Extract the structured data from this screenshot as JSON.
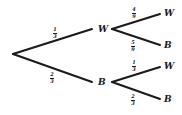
{
  "tree": {
    "stage1": [
      {
        "outcome": "W",
        "probability": "1/3",
        "num": "1",
        "den": "3"
      },
      {
        "outcome": "B",
        "probability": "2/3",
        "num": "2",
        "den": "3"
      }
    ],
    "stage2_after_W": [
      {
        "outcome": "W",
        "probability": "4/9",
        "num": "4",
        "den": "9"
      },
      {
        "outcome": "B",
        "probability": "5/9",
        "num": "5",
        "den": "9"
      }
    ],
    "stage2_after_B": [
      {
        "outcome": "W",
        "probability": "1/3",
        "num": "1",
        "den": "3"
      },
      {
        "outcome": "B",
        "probability": "2/3",
        "num": "2",
        "den": "3"
      }
    ]
  }
}
